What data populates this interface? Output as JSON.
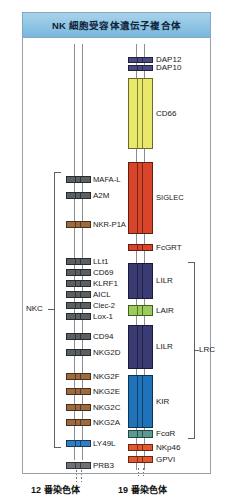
{
  "figure": {
    "title": "NK 細胞受容体遺伝子複合体",
    "left_chromosome_caption": "12 番染色体",
    "right_chromosome_caption": "19 番染色体",
    "bracket_labels": {
      "nkc": "NKC",
      "lrc": "LRC"
    }
  },
  "colors": {
    "banner_fill": "#8ec4e4",
    "banner_border": "#7ea8c4",
    "frame_border": "#9aa0a6",
    "rail": "#8a8f94",
    "gray_gene": "#5a5f63",
    "brown_gene": "#9b6b3f",
    "blue_gene": "#2f7dc4",
    "dark_gray_gene": "#6e7276",
    "purple_gene": "#4a4a80",
    "yellow_gene": "#e8e86a",
    "red_gene": "#d8452a",
    "navy_gene": "#3b3b74",
    "green_gene": "#9bcc5a",
    "mid_blue_gene": "#1f73b8",
    "teal_gene": "#5a9a92",
    "orange_gene": "#e2582f"
  },
  "left_chromosome": {
    "name": "12 番染色体",
    "genes": [
      {
        "label": "MAFA-L",
        "color": "#5a5f63",
        "y": 176,
        "h": 7
      },
      {
        "label": "A2M",
        "color": "#5a5f63",
        "y": 192,
        "h": 7
      },
      {
        "label": "NKR-P1A",
        "color": "#9b6b3f",
        "y": 221,
        "h": 7
      },
      {
        "label": "LLt1",
        "color": "#5a5f63",
        "y": 258,
        "h": 7
      },
      {
        "label": "CD69",
        "color": "#5a5f63",
        "y": 269,
        "h": 7
      },
      {
        "label": "KLRF1",
        "color": "#5a5f63",
        "y": 280,
        "h": 7
      },
      {
        "label": "AICL",
        "color": "#5a5f63",
        "y": 291,
        "h": 7
      },
      {
        "label": "Clec-2",
        "color": "#5a5f63",
        "y": 302,
        "h": 7
      },
      {
        "label": "Lox-1",
        "color": "#5a5f63",
        "y": 313,
        "h": 7
      },
      {
        "label": "CD94",
        "color": "#5a5f63",
        "y": 333,
        "h": 7
      },
      {
        "label": "NKG2D",
        "color": "#5a5f63",
        "y": 349,
        "h": 7
      },
      {
        "label": "NKG2F",
        "color": "#9b6b3f",
        "y": 373,
        "h": 7
      },
      {
        "label": "NKG2E",
        "color": "#9b6b3f",
        "y": 388,
        "h": 7
      },
      {
        "label": "NKG2C",
        "color": "#9b6b3f",
        "y": 404,
        "h": 7
      },
      {
        "label": "NKG2A",
        "color": "#9b6b3f",
        "y": 419,
        "h": 7
      },
      {
        "label": "LY49L",
        "color": "#2f7dc4",
        "y": 440,
        "h": 7
      },
      {
        "label": "PRB3",
        "color": "#6e7276",
        "y": 462,
        "h": 7
      }
    ],
    "nkc_bracket": {
      "label": "NKC",
      "top": 172,
      "bottom": 446
    }
  },
  "right_chromosome": {
    "name": "19 番染色体",
    "genes": [
      {
        "label": "DAP12",
        "color": "#4a4a80",
        "y": 57,
        "h": 6,
        "type": "single"
      },
      {
        "label": "DAP10",
        "color": "#4a4a80",
        "y": 65,
        "h": 6,
        "type": "single"
      },
      {
        "label": "CD66",
        "color": "#e8e86a",
        "y": 78,
        "h": 71,
        "type": "cluster"
      },
      {
        "label": "SIGLEC",
        "color": "#d8452a",
        "y": 162,
        "h": 72,
        "type": "cluster"
      },
      {
        "label": "FcGRT",
        "color": "#d8452a",
        "y": 244,
        "h": 7,
        "type": "single"
      },
      {
        "label": "LILR",
        "color": "#3b3b74",
        "y": 263,
        "h": 36,
        "type": "cluster"
      },
      {
        "label": "LAIR",
        "color": "#9bcc5a",
        "y": 305,
        "h": 11,
        "type": "cluster"
      },
      {
        "label": "LILR",
        "color": "#3b3b74",
        "y": 325,
        "h": 44,
        "type": "cluster"
      },
      {
        "label": "KIR",
        "color": "#1f73b8",
        "y": 375,
        "h": 53,
        "type": "cluster"
      },
      {
        "label": "FcαR",
        "color": "#5a9a92",
        "y": 430,
        "h": 8,
        "type": "single"
      },
      {
        "label": "NKp46",
        "color": "#e2582f",
        "y": 444,
        "h": 7,
        "type": "single"
      },
      {
        "label": "GPVI",
        "color": "#e2582f",
        "y": 456,
        "h": 7,
        "type": "single"
      }
    ],
    "lrc_bracket": {
      "label": "LRC",
      "top": 262,
      "bottom": 437
    }
  }
}
